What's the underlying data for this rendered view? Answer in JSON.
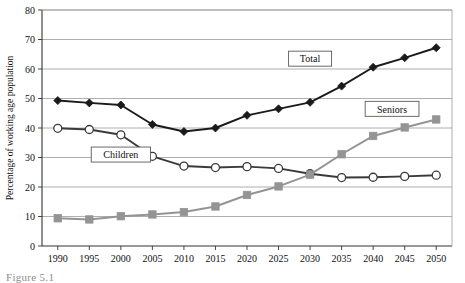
{
  "figure": {
    "caption": "Figure 5.1"
  },
  "chart_data": {
    "type": "line",
    "title": "",
    "xlabel": "",
    "ylabel": "Percentage of working age population",
    "categories": [
      "1990",
      "1995",
      "2000",
      "2005",
      "2010",
      "2015",
      "2020",
      "2025",
      "2030",
      "2035",
      "2040",
      "2045",
      "2050"
    ],
    "x": [
      1990,
      1995,
      2000,
      2005,
      2010,
      2015,
      2020,
      2025,
      2030,
      2035,
      2040,
      2045,
      2050
    ],
    "xlim": [
      1987.5,
      2052.5
    ],
    "ylim": [
      0,
      80
    ],
    "yticks": [
      0,
      10,
      20,
      30,
      40,
      50,
      60,
      70,
      80
    ],
    "ytick_labels": [
      "0",
      "10",
      "20",
      "30",
      "40",
      "50",
      "60",
      "70",
      "80"
    ],
    "grid": "horizontal",
    "legend_position": "inline-callouts",
    "series": [
      {
        "name": "Total",
        "label": "Total",
        "color": "#1a1a1a",
        "marker": "diamond",
        "values": [
          49.3,
          48.5,
          47.8,
          41.2,
          38.8,
          40.0,
          44.3,
          46.5,
          48.7,
          54.2,
          60.6,
          63.8,
          67.2
        ]
      },
      {
        "name": "Children",
        "label": "Children",
        "color": "#3a3a3a",
        "marker": "open-circle",
        "values": [
          39.9,
          39.5,
          37.7,
          30.4,
          27.1,
          26.6,
          26.9,
          26.3,
          24.5,
          23.2,
          23.3,
          23.6,
          24.0
        ]
      },
      {
        "name": "Seniors",
        "label": "Seniors",
        "color": "#949494",
        "marker": "square",
        "values": [
          9.4,
          9.0,
          10.1,
          10.7,
          11.5,
          13.4,
          17.3,
          20.2,
          24.2,
          31.1,
          37.3,
          40.2,
          42.9
        ]
      }
    ],
    "annotations": [
      {
        "text": "Total",
        "x": 2030,
        "y": 63.5
      },
      {
        "text": "Children",
        "x": 2000,
        "y": 31.0
      },
      {
        "text": "Seniors",
        "x": 2043,
        "y": 46.5
      }
    ]
  }
}
